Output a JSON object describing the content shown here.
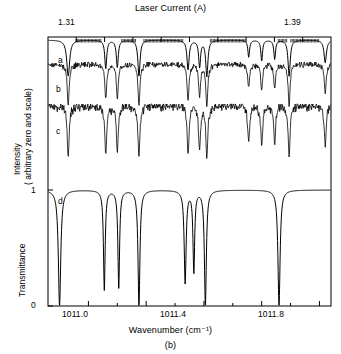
{
  "figure": {
    "panel_label": "(b)",
    "top_axis_title": "Laser Current (A)",
    "x_axis_title": "Wavenumber (cm⁻¹)",
    "y_axis_title_top": "Intensity",
    "y_axis_title_top2": "( arbitrary zero and scale)",
    "y_axis_title_bottom": "Transmittance"
  },
  "top_axis": {
    "labels": [
      "1.31",
      "1.39"
    ],
    "label_positions": [
      1.31,
      1.39
    ],
    "range": [
      1.3,
      1.4
    ],
    "major_ticks": [
      1.31,
      1.32,
      1.33,
      1.34,
      1.35,
      1.36,
      1.37,
      1.38,
      1.39
    ]
  },
  "traces": {
    "labels": [
      "a",
      "b",
      "c",
      "d"
    ],
    "descriptions": {
      "a": "observed spectrum, smoothed",
      "b": "observed spectrum, noisy",
      "c": "observed spectrum, noisy",
      "d": "calculated transmittance"
    }
  },
  "chart_data": {
    "type": "line",
    "title": "",
    "xlabel": "Wavenumber (cm⁻¹)",
    "ylabel": "Intensity ( arbitrary zero and scale) / Transmittance",
    "xlim": [
      1010.86,
      1011.84
    ],
    "xticks": [
      1011.0,
      1011.4,
      1011.8
    ],
    "xtick_labels": [
      "1011.0",
      "1011.4",
      "1011.8"
    ],
    "xminor_step": 0.1,
    "ylim": [
      0,
      1
    ],
    "yticks_bottom": [
      0,
      1
    ],
    "ytick_labels_bottom": [
      "0",
      "1"
    ],
    "grid": false,
    "legend": "none",
    "secondary_x_axis": {
      "label": "Laser Current (A)",
      "range": [
        1.3,
        1.4
      ],
      "tick_labels": [
        "1.31",
        "1.39"
      ]
    },
    "series": [
      {
        "name": "a",
        "label": "a",
        "kind": "observed-smoothed",
        "absorption_centers": [
          1010.93,
          1011.06,
          1011.1,
          1011.175,
          1011.345,
          1011.385,
          1011.41,
          1011.555,
          1011.6,
          1011.645,
          1011.695,
          1011.82
        ],
        "absorption_depths": [
          0.95,
          0.75,
          0.72,
          0.95,
          0.78,
          0.7,
          0.95,
          0.45,
          0.55,
          0.5,
          0.95,
          0.6
        ],
        "absorption_widths": [
          0.012,
          0.008,
          0.008,
          0.009,
          0.009,
          0.008,
          0.009,
          0.007,
          0.007,
          0.007,
          0.009,
          0.01
        ]
      },
      {
        "name": "b",
        "label": "b",
        "kind": "observed-noisy",
        "absorption_centers": [
          1010.93,
          1011.06,
          1011.1,
          1011.175,
          1011.345,
          1011.385,
          1011.41,
          1011.555,
          1011.6,
          1011.645,
          1011.695,
          1011.82
        ],
        "absorption_depths": [
          0.95,
          0.8,
          0.78,
          0.95,
          0.82,
          0.74,
          0.95,
          0.55,
          0.6,
          0.55,
          0.95,
          0.65
        ],
        "noise_amplitude": 0.1
      },
      {
        "name": "c",
        "label": "c",
        "kind": "observed-noisy",
        "absorption_centers": [
          1010.93,
          1011.06,
          1011.1,
          1011.175,
          1011.345,
          1011.385,
          1011.41,
          1011.555,
          1011.6,
          1011.645,
          1011.695,
          1011.82
        ],
        "absorption_depths": [
          0.95,
          0.88,
          0.85,
          0.95,
          0.88,
          0.82,
          0.95,
          0.7,
          0.72,
          0.68,
          0.95,
          0.75
        ],
        "noise_amplitude": 0.14
      },
      {
        "name": "d",
        "label": "d",
        "kind": "calculated-transmittance",
        "baseline": 1.0,
        "absorption_centers": [
          1010.9,
          1011.055,
          1011.105,
          1011.175,
          1011.335,
          1011.365,
          1011.405,
          1011.66
        ],
        "absorption_depths": [
          1.0,
          0.86,
          0.84,
          1.0,
          0.8,
          0.7,
          1.0,
          1.0
        ],
        "absorption_widths": [
          0.01,
          0.007,
          0.007,
          0.008,
          0.008,
          0.007,
          0.008,
          0.009
        ]
      }
    ]
  }
}
